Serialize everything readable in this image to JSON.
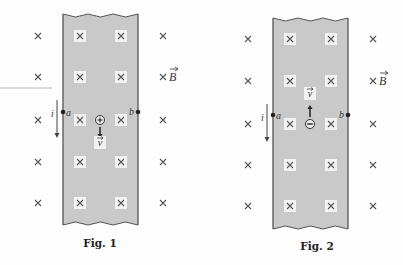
{
  "figures": [
    {
      "caption": "Fig. 1",
      "strip": {
        "left": 63,
        "right": 138,
        "top": 14,
        "bottom": 225
      },
      "rows_y": [
        36,
        77,
        120,
        162,
        203
      ],
      "outer_x": [
        38,
        163
      ],
      "inner_x": [
        80,
        121
      ],
      "field_label": "B",
      "field_label_row": 1,
      "current_label": "i",
      "current_arrow": {
        "x": 57,
        "y1": 100,
        "y2": 138
      },
      "point_a": {
        "label": "a",
        "x": 63,
        "y": 112
      },
      "point_b": {
        "label": "b",
        "x": 138,
        "y": 112
      },
      "charge": {
        "sign": "+",
        "x": 100,
        "y": 120
      },
      "velocity": {
        "label": "v",
        "direction": "down",
        "arrow_from": 127,
        "arrow_to": 138,
        "label_y": 146
      },
      "caption_pos": {
        "x": 100,
        "y": 247
      }
    },
    {
      "caption": "Fig. 2",
      "strip": {
        "left": 273,
        "right": 348,
        "top": 18,
        "bottom": 229
      },
      "rows_y": [
        39,
        81,
        124,
        165,
        206
      ],
      "outer_x": [
        248,
        373
      ],
      "inner_x": [
        290,
        331
      ],
      "field_label": "B",
      "field_label_row": 1,
      "current_label": "i",
      "current_arrow": {
        "x": 267,
        "y1": 104,
        "y2": 142
      },
      "point_a": {
        "label": "a",
        "x": 273,
        "y": 115
      },
      "point_b": {
        "label": "b",
        "x": 348,
        "y": 115
      },
      "charge": {
        "sign": "−",
        "x": 310,
        "y": 124
      },
      "velocity": {
        "label": "v",
        "direction": "up",
        "arrow_from": 117,
        "arrow_to": 105,
        "label_y": 97
      },
      "caption_pos": {
        "x": 317,
        "y": 250
      }
    }
  ],
  "colors": {
    "strip_fill": "#c9c9c9",
    "strip_edge": "#555555",
    "cross": "#555555",
    "cross_patch": "#f2f2f2",
    "text": "#333333"
  }
}
